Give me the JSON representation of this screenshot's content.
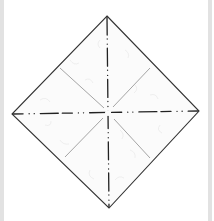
{
  "diagram": {
    "type": "origami-fold-diagram",
    "colors": {
      "background": "#ffffff",
      "frame_bar": "#e2e2e2",
      "paper_fill": "#fbfbfb",
      "paper_texture": "#e6e6e6",
      "edge": "#333333",
      "mountain_fold": "#222222",
      "valley_crease": "#9a9a9a"
    },
    "paper": {
      "vertices": {
        "top": [
          107,
          16
        ],
        "right": [
          199,
          111
        ],
        "bottom": [
          109,
          208
        ],
        "left": [
          12,
          114
        ]
      },
      "center": [
        108,
        113
      ]
    },
    "fold_lines": [
      {
        "name": "vertical-mountain-fold",
        "style": "dash-dot-dot",
        "from": [
          107,
          16
        ],
        "to": [
          109,
          208
        ]
      },
      {
        "name": "horizontal-mountain-fold",
        "style": "dash-dot-dot",
        "from": [
          12,
          114
        ],
        "to": [
          199,
          111
        ]
      }
    ],
    "creases": [
      {
        "name": "upper-left-crease",
        "style": "solid-thin",
        "from": [
          104,
          108
        ],
        "to": [
          60,
          68
        ]
      },
      {
        "name": "upper-right-crease",
        "style": "solid-thin",
        "from": [
          113,
          107
        ],
        "to": [
          150,
          68
        ]
      },
      {
        "name": "lower-left-crease",
        "style": "solid-thin",
        "from": [
          103,
          118
        ],
        "to": [
          65,
          157
        ]
      },
      {
        "name": "lower-right-crease",
        "style": "solid-thin",
        "from": [
          114,
          119
        ],
        "to": [
          150,
          158
        ]
      }
    ]
  }
}
